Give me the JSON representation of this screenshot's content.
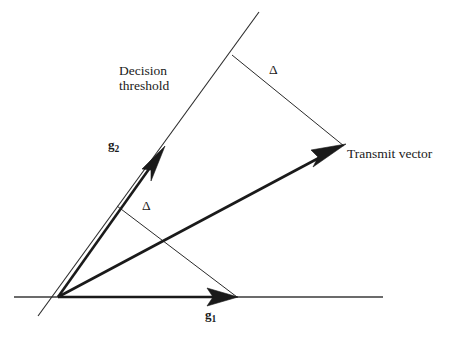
{
  "figure": {
    "type": "vector-geometry-diagram",
    "background_color": "#ffffff",
    "stroke_color": "#1a1a1a",
    "labels": {
      "decision_threshold_line1": "Decision",
      "decision_threshold_line2": "threshold",
      "transmit_vector": "Transmit vector",
      "basis_vector_2": "g",
      "basis_vector_2_subscript": "2",
      "basis_vector_1": "g",
      "basis_vector_1_subscript": "1",
      "delta_upper": "Δ",
      "delta_lower": "Δ"
    },
    "geometry": {
      "origin": [
        58,
        297
      ],
      "axis_line": {
        "x1": 14,
        "y1": 297,
        "x2": 383,
        "y2": 297
      },
      "decision_threshold_line": {
        "x1": 38,
        "y1": 316,
        "x2": 259,
        "y2": 12
      },
      "vector_g1": {
        "x1": 58,
        "y1": 297,
        "x2": 237,
        "y2": 297
      },
      "vector_g2": {
        "x1": 58,
        "y1": 297,
        "x2": 165,
        "y2": 146
      },
      "vector_transmit": {
        "x1": 58,
        "y1": 297,
        "x2": 346,
        "y2": 144
      },
      "delta_segment_upper": {
        "x1": 232,
        "y1": 55,
        "x2": 344,
        "y2": 146
      },
      "delta_segment_lower": {
        "x1": 117,
        "y1": 206,
        "x2": 237,
        "y2": 297
      }
    }
  }
}
